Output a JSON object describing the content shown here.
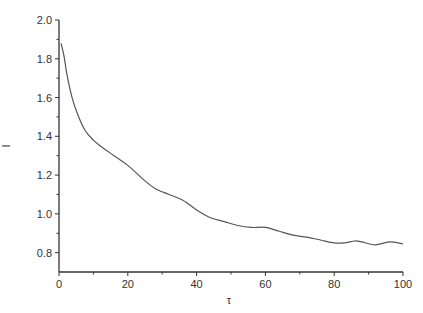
{
  "chart_data": {
    "type": "line",
    "title": "",
    "xlabel": "τ",
    "ylabel": "I",
    "xlim": [
      0,
      100
    ],
    "ylim": [
      0.7,
      2.0
    ],
    "x_ticks": [
      0,
      20,
      40,
      60,
      80,
      100
    ],
    "x_tick_labels": [
      "0",
      "20",
      "40",
      "60",
      "80",
      "100"
    ],
    "y_ticks": [
      0.8,
      1.0,
      1.2,
      1.4,
      1.6,
      1.8,
      2.0
    ],
    "y_tick_labels": [
      "0.8",
      "1.0",
      "1.2",
      "1.4",
      "1.6",
      "1.8",
      "2.0"
    ],
    "x_minor_ticks": [
      10,
      30,
      50,
      70,
      90
    ],
    "y_minor_ticks": [
      0.9,
      1.1,
      1.3,
      1.5,
      1.7,
      1.9
    ],
    "grid": false,
    "legend": null,
    "series": [
      {
        "name": "I(τ)",
        "color": "#555555",
        "x": [
          0.6,
          1.5,
          2.3,
          3.8,
          5.5,
          7.6,
          10,
          12,
          16,
          20,
          25,
          28,
          32,
          36,
          40,
          44,
          48,
          52,
          56,
          60,
          64,
          68,
          72,
          76,
          80,
          83,
          86,
          88,
          92,
          96,
          100
        ],
        "y": [
          1.88,
          1.81,
          1.72,
          1.6,
          1.51,
          1.43,
          1.38,
          1.35,
          1.3,
          1.25,
          1.17,
          1.13,
          1.1,
          1.07,
          1.02,
          0.98,
          0.96,
          0.94,
          0.93,
          0.93,
          0.91,
          0.89,
          0.88,
          0.865,
          0.85,
          0.85,
          0.86,
          0.855,
          0.84,
          0.855,
          0.845
        ]
      }
    ]
  },
  "axes": {
    "xlabel": "τ",
    "ylabel": "I",
    "line_color": "#333333"
  }
}
